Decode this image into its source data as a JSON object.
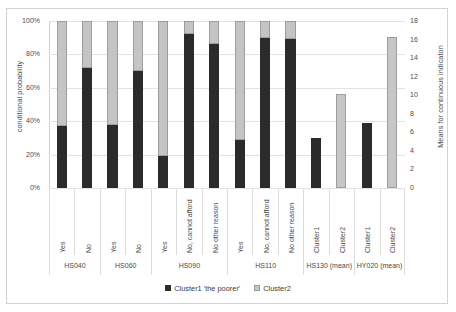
{
  "chart_data": {
    "type": "bar",
    "title": "",
    "subtitle": "",
    "ylabel": "conditional probability",
    "ylabel_secondary": "Means for continuous indicaton",
    "xlabel": "",
    "grid": true,
    "legend_position": "bottom",
    "ylim": [
      0,
      100
    ],
    "ylim_secondary": [
      0,
      18
    ],
    "ytick_labels": [
      "0%",
      "20%",
      "40%",
      "60%",
      "80%",
      "100%"
    ],
    "ytick_values": [
      0,
      20,
      40,
      60,
      80,
      100
    ],
    "ytick_labels_secondary": [
      "0",
      "2",
      "4",
      "6",
      "8",
      "10",
      "12",
      "14",
      "16",
      "18"
    ],
    "ytick_values_secondary": [
      0,
      2,
      4,
      6,
      8,
      10,
      12,
      14,
      16,
      18
    ],
    "legend": [
      {
        "name": "Cluster1 'the poorer'",
        "color": "#2b2b2b"
      },
      {
        "name": "Cluster2",
        "color": "#c6c6c6"
      }
    ],
    "groups": [
      {
        "name": "HS040",
        "categories": [
          "Yes",
          "No"
        ]
      },
      {
        "name": "HS060",
        "categories": [
          "Yes",
          "No"
        ]
      },
      {
        "name": "HS090",
        "categories": [
          "Yes",
          "No, cannot afford",
          "No other reason"
        ]
      },
      {
        "name": "HS110",
        "categories": [
          "Yes",
          "No, cannot afford",
          "No other reason"
        ]
      },
      {
        "name": "HS130 (mean)",
        "categories": [
          "Cluster1",
          "Cluster2"
        ]
      },
      {
        "name": "HY020 (mean)",
        "categories": [
          "Cluster1",
          "Cluster2"
        ]
      }
    ],
    "categories": [
      "Yes",
      "No",
      "Yes",
      "No",
      "Yes",
      "No, cannot afford",
      "No other reason",
      "Yes",
      "No, cannot afford",
      "No other reason",
      "Cluster1",
      "Cluster2",
      "Cluster1",
      "Cluster2"
    ],
    "series": [
      {
        "name": "Cluster1 'the poorer'",
        "axis": "left",
        "values": [
          37,
          72,
          38,
          70,
          19,
          92,
          86,
          29,
          90,
          89,
          null,
          null,
          null,
          null
        ]
      },
      {
        "name": "Cluster2",
        "axis": "left",
        "values": [
          63,
          28,
          62,
          30,
          81,
          8,
          14,
          71,
          10,
          11,
          null,
          null,
          null,
          null
        ]
      },
      {
        "name": "Means (secondary axis)",
        "axis": "right",
        "values": [
          null,
          null,
          null,
          null,
          null,
          null,
          null,
          null,
          null,
          null,
          5.4,
          10.1,
          7.0,
          16.3
        ]
      }
    ],
    "bars": [
      {
        "category": "Yes",
        "group": "HS040",
        "axis": "left",
        "cluster1": 37,
        "cluster2": 63
      },
      {
        "category": "No",
        "group": "HS040",
        "axis": "left",
        "cluster1": 72,
        "cluster2": 28
      },
      {
        "category": "Yes",
        "group": "HS060",
        "axis": "left",
        "cluster1": 38,
        "cluster2": 62
      },
      {
        "category": "No",
        "group": "HS060",
        "axis": "left",
        "cluster1": 70,
        "cluster2": 30
      },
      {
        "category": "Yes",
        "group": "HS090",
        "axis": "left",
        "cluster1": 19,
        "cluster2": 81
      },
      {
        "category": "No, cannot afford",
        "group": "HS090",
        "axis": "left",
        "cluster1": 92,
        "cluster2": 8
      },
      {
        "category": "No other reason",
        "group": "HS090",
        "axis": "left",
        "cluster1": 86,
        "cluster2": 14
      },
      {
        "category": "Yes",
        "group": "HS110",
        "axis": "left",
        "cluster1": 29,
        "cluster2": 71
      },
      {
        "category": "No, cannot afford",
        "group": "HS110",
        "axis": "left",
        "cluster1": 90,
        "cluster2": 10
      },
      {
        "category": "No other reason",
        "group": "HS110",
        "axis": "left",
        "cluster1": 89,
        "cluster2": 11
      },
      {
        "category": "Cluster1",
        "group": "HS130 (mean)",
        "axis": "right",
        "value": 5.4,
        "series": "Cluster1 'the poorer'"
      },
      {
        "category": "Cluster2",
        "group": "HS130 (mean)",
        "axis": "right",
        "value": 10.1,
        "series": "Cluster2"
      },
      {
        "category": "Cluster1",
        "group": "HY020 (mean)",
        "axis": "right",
        "value": 7.0,
        "series": "Cluster1 'the poorer'"
      },
      {
        "category": "Cluster2",
        "group": "HY020 (mean)",
        "axis": "right",
        "value": 16.3,
        "series": "Cluster2"
      }
    ]
  },
  "colors": {
    "cluster1": "#2b2b2b",
    "cluster2": "#c6c6c6",
    "grid": "#e3e3e3",
    "text": "#4a4a4a",
    "frame": "#d2d2d2"
  }
}
